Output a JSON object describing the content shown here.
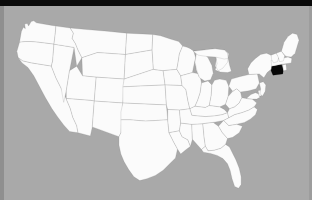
{
  "map": {
    "title": "United States map",
    "projection_note": "contiguous 48 states",
    "background_color": "#a9a9a9",
    "state_fill_color": "#fbfbfb",
    "state_border_color": "#6f6f6f",
    "highlight_color": "#070707",
    "water_color": "#a9a9a9",
    "highlighted_state": "Connecticut",
    "highlighted_state_abbr": "CT",
    "states": [
      {
        "abbr": "WA",
        "name": "Washington",
        "highlighted": false
      },
      {
        "abbr": "OR",
        "name": "Oregon",
        "highlighted": false
      },
      {
        "abbr": "CA",
        "name": "California",
        "highlighted": false
      },
      {
        "abbr": "NV",
        "name": "Nevada",
        "highlighted": false
      },
      {
        "abbr": "ID",
        "name": "Idaho",
        "highlighted": false
      },
      {
        "abbr": "MT",
        "name": "Montana",
        "highlighted": false
      },
      {
        "abbr": "WY",
        "name": "Wyoming",
        "highlighted": false
      },
      {
        "abbr": "UT",
        "name": "Utah",
        "highlighted": false
      },
      {
        "abbr": "AZ",
        "name": "Arizona",
        "highlighted": false
      },
      {
        "abbr": "CO",
        "name": "Colorado",
        "highlighted": false
      },
      {
        "abbr": "NM",
        "name": "New Mexico",
        "highlighted": false
      },
      {
        "abbr": "ND",
        "name": "North Dakota",
        "highlighted": false
      },
      {
        "abbr": "SD",
        "name": "South Dakota",
        "highlighted": false
      },
      {
        "abbr": "NE",
        "name": "Nebraska",
        "highlighted": false
      },
      {
        "abbr": "KS",
        "name": "Kansas",
        "highlighted": false
      },
      {
        "abbr": "OK",
        "name": "Oklahoma",
        "highlighted": false
      },
      {
        "abbr": "TX",
        "name": "Texas",
        "highlighted": false
      },
      {
        "abbr": "MN",
        "name": "Minnesota",
        "highlighted": false
      },
      {
        "abbr": "IA",
        "name": "Iowa",
        "highlighted": false
      },
      {
        "abbr": "MO",
        "name": "Missouri",
        "highlighted": false
      },
      {
        "abbr": "AR",
        "name": "Arkansas",
        "highlighted": false
      },
      {
        "abbr": "LA",
        "name": "Louisiana",
        "highlighted": false
      },
      {
        "abbr": "WI",
        "name": "Wisconsin",
        "highlighted": false
      },
      {
        "abbr": "IL",
        "name": "Illinois",
        "highlighted": false
      },
      {
        "abbr": "MS",
        "name": "Mississippi",
        "highlighted": false
      },
      {
        "abbr": "MI",
        "name": "Michigan",
        "highlighted": false
      },
      {
        "abbr": "IN",
        "name": "Indiana",
        "highlighted": false
      },
      {
        "abbr": "KY",
        "name": "Kentucky",
        "highlighted": false
      },
      {
        "abbr": "TN",
        "name": "Tennessee",
        "highlighted": false
      },
      {
        "abbr": "AL",
        "name": "Alabama",
        "highlighted": false
      },
      {
        "abbr": "OH",
        "name": "Ohio",
        "highlighted": false
      },
      {
        "abbr": "GA",
        "name": "Georgia",
        "highlighted": false
      },
      {
        "abbr": "FL",
        "name": "Florida",
        "highlighted": false
      },
      {
        "abbr": "SC",
        "name": "South Carolina",
        "highlighted": false
      },
      {
        "abbr": "NC",
        "name": "North Carolina",
        "highlighted": false
      },
      {
        "abbr": "VA",
        "name": "Virginia",
        "highlighted": false
      },
      {
        "abbr": "WV",
        "name": "West Virginia",
        "highlighted": false
      },
      {
        "abbr": "MD",
        "name": "Maryland",
        "highlighted": false
      },
      {
        "abbr": "DE",
        "name": "Delaware",
        "highlighted": false
      },
      {
        "abbr": "PA",
        "name": "Pennsylvania",
        "highlighted": false
      },
      {
        "abbr": "NJ",
        "name": "New Jersey",
        "highlighted": false
      },
      {
        "abbr": "NY",
        "name": "New York",
        "highlighted": false
      },
      {
        "abbr": "CT",
        "name": "Connecticut",
        "highlighted": true
      },
      {
        "abbr": "RI",
        "name": "Rhode Island",
        "highlighted": false
      },
      {
        "abbr": "MA",
        "name": "Massachusetts",
        "highlighted": false
      },
      {
        "abbr": "VT",
        "name": "Vermont",
        "highlighted": false
      },
      {
        "abbr": "NH",
        "name": "New Hampshire",
        "highlighted": false
      },
      {
        "abbr": "ME",
        "name": "Maine",
        "highlighted": false
      }
    ],
    "lakes": [
      {
        "name": "Lake Superior"
      },
      {
        "name": "Lake Michigan"
      },
      {
        "name": "Lake Huron"
      },
      {
        "name": "Lake Erie"
      },
      {
        "name": "Lake Ontario"
      }
    ]
  }
}
